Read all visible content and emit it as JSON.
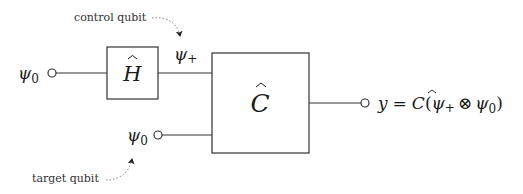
{
  "diagram": {
    "annotations": {
      "control_label": "control qubit",
      "target_label": "target qubit"
    },
    "inputs": {
      "control_input": "ψ",
      "control_input_sub": "0",
      "target_input": "ψ",
      "target_input_sub": "0"
    },
    "gates": {
      "hadamard": "H",
      "controlled": "C"
    },
    "intermediate": {
      "after_hadamard": "ψ",
      "after_hadamard_sub": "+"
    },
    "output": {
      "lhs": "y",
      "eq": "=",
      "op": "C",
      "open": "(",
      "psi1": "ψ",
      "psi1_sub": "+",
      "tensor": "⊗",
      "psi2": "ψ",
      "psi2_sub": "0",
      "close": ")"
    },
    "colors": {
      "stroke": "#333333",
      "annotation_arrow": "#888888"
    }
  }
}
